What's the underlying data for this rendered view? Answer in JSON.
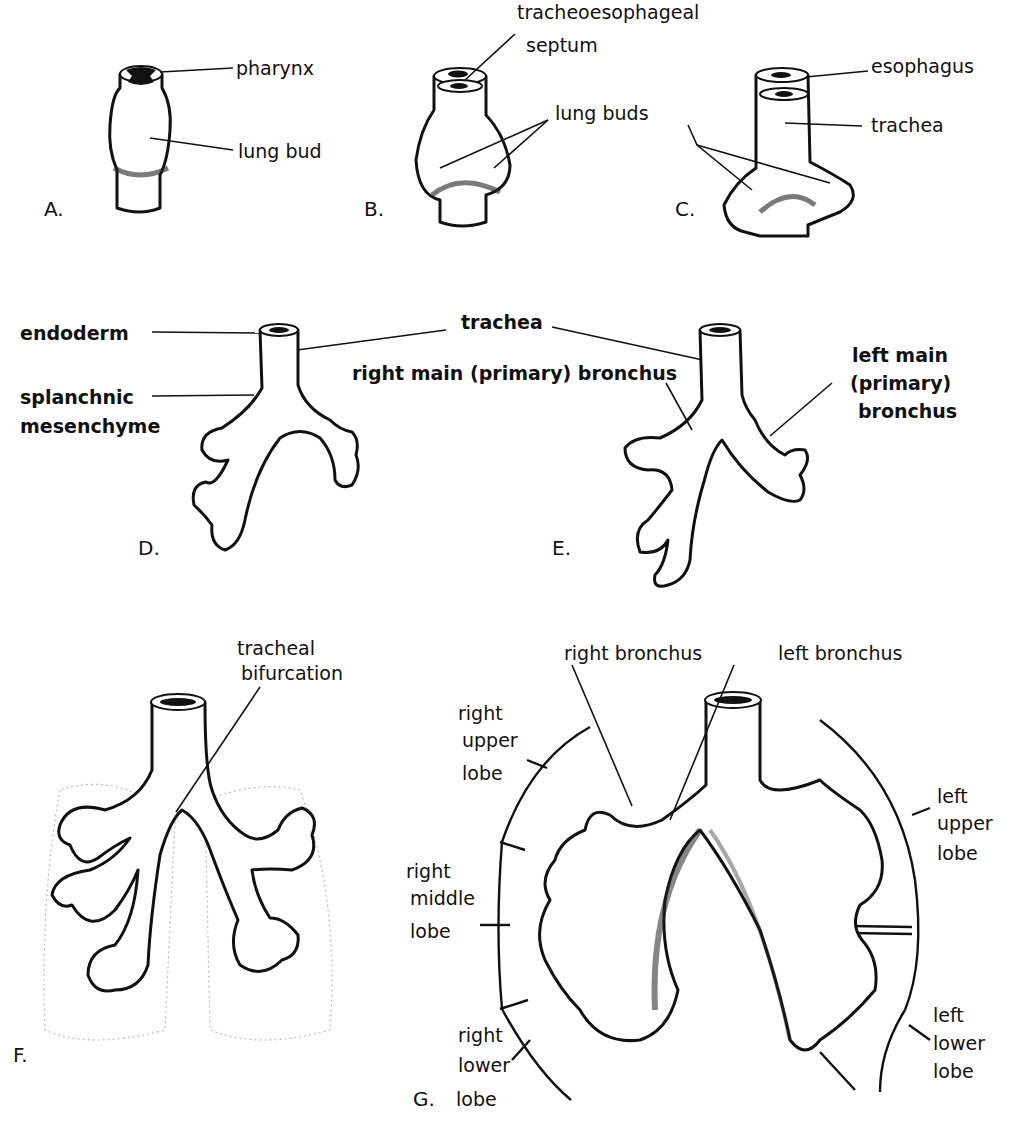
{
  "figure": {
    "panels": {
      "A": {
        "letter": "A.",
        "labels": {
          "pharynx": "pharynx",
          "lung_bud": "lung bud"
        }
      },
      "B": {
        "letter": "B.",
        "labels": {
          "septum_1": "tracheoesophageal",
          "septum_2": "septum",
          "lung_buds": "lung buds"
        }
      },
      "C": {
        "letter": "C.",
        "labels": {
          "esophagus": "esophagus",
          "trachea": "trachea"
        }
      },
      "D": {
        "letter": "D.",
        "labels": {
          "endoderm": "endoderm",
          "splanchnic_1": "splanchnic",
          "splanchnic_2": "mesenchyme"
        }
      },
      "DE_shared": {
        "trachea": "trachea"
      },
      "E": {
        "letter": "E.",
        "labels": {
          "right_main": "right main (primary) bronchus",
          "left_main_1": "left main",
          "left_main_2": "(primary)",
          "left_main_3": "bronchus"
        }
      },
      "F": {
        "letter": "F.",
        "labels": {
          "bif_1": "tracheal",
          "bif_2": "bifurcation"
        }
      },
      "G": {
        "letter": "G.",
        "labels": {
          "right_bronchus": "right bronchus",
          "left_bronchus": "left bronchus",
          "rul_1": "right",
          "rul_2": "upper",
          "rul_3": "lobe",
          "rml_1": "right",
          "rml_2": "middle",
          "rml_3": "lobe",
          "rll_1": "right",
          "rll_2": "lower",
          "rll_3": "lobe",
          "lul_1": "left",
          "lul_2": "upper",
          "lul_3": "lobe",
          "lll_1": "left",
          "lll_2": "lower",
          "lll_3": "lobe"
        }
      }
    },
    "colors": {
      "ink": "#111111",
      "background": "#ffffff"
    }
  }
}
